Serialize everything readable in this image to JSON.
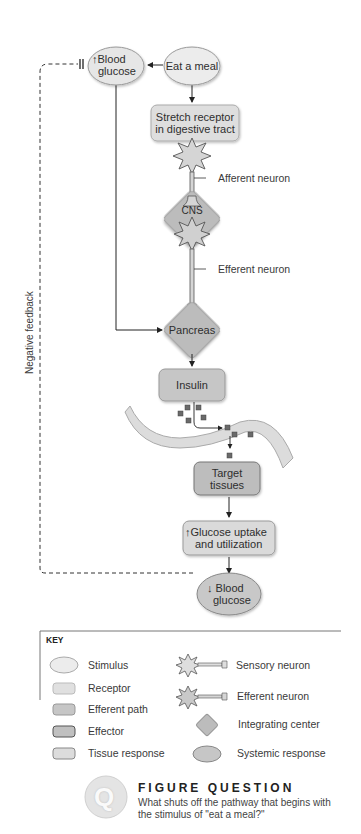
{
  "diagram": {
    "nodes": {
      "blood_glucose_up": {
        "arrow": "↑",
        "line1": "Blood",
        "line2": "glucose",
        "type": "systemic-response"
      },
      "eat_a_meal": {
        "label": "Eat a meal",
        "type": "stimulus"
      },
      "stretch_receptor": {
        "line1": "Stretch receptor",
        "line2": "in digestive tract",
        "type": "receptor"
      },
      "cns": {
        "label": "CNS",
        "type": "integrating-center"
      },
      "pancreas": {
        "label": "Pancreas",
        "type": "integrating-center"
      },
      "insulin": {
        "label": "Insulin",
        "type": "efferent-path"
      },
      "target_tissues": {
        "line1": "Target",
        "line2": "tissues",
        "type": "effector"
      },
      "glucose_uptake": {
        "arrow": "↑",
        "line1": "Glucose uptake",
        "line2": "and utilization",
        "type": "tissue-response"
      },
      "blood_glucose_down": {
        "arrow": "↓",
        "line1": "Blood",
        "line2": "glucose",
        "type": "systemic-response"
      }
    },
    "labels": {
      "afferent_neuron": "Afferent neuron",
      "efferent_neuron": "Efferent neuron",
      "negative_feedback": "Negative feedback"
    },
    "colors": {
      "stimulus": "#e9e9e9",
      "receptor": "#dcdcdc",
      "efferent_path": "#c4c4c4",
      "effector": "#bdbdbd",
      "tissue_response": "#d9d9d9",
      "integrating_center": "#b8b8b8",
      "systemic_response": "#c8c8c8",
      "line": "#333333"
    }
  },
  "key": {
    "title": "KEY",
    "items": [
      {
        "label": "Stimulus",
        "shape": "ellipse-light"
      },
      {
        "label": "Receptor",
        "shape": "rect-light"
      },
      {
        "label": "Efferent path",
        "shape": "rect-mid"
      },
      {
        "label": "Effector",
        "shape": "rect-dark-border"
      },
      {
        "label": "Tissue response",
        "shape": "rect-light-border"
      },
      {
        "label": "Sensory neuron",
        "shape": "sensory-neuron"
      },
      {
        "label": "Efferent neuron",
        "shape": "efferent-neuron"
      },
      {
        "label": "Integrating center",
        "shape": "diamond"
      },
      {
        "label": "Systemic response",
        "shape": "ellipse-dark"
      }
    ]
  },
  "figure_question": {
    "icon": "Q",
    "title": "FIGURE QUESTION",
    "text": "What shuts off the pathway that begins with the stimulus of \"eat a meal?\""
  }
}
